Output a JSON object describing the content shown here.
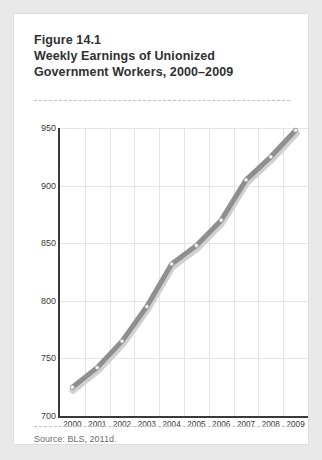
{
  "figure": {
    "label": "Figure 14.1",
    "title_line_1": "Weekly Earnings of Unionized",
    "title_line_2": "Government Workers, 2000–2009",
    "source": "Source: BLS, 2011d."
  },
  "colors": {
    "line": "#8f8f8f",
    "line_shadow": "#d0d0d0",
    "marker_fill": "#ffffff",
    "marker_stroke": "#9a9a9a",
    "axis": "#3a3a3a",
    "grid": "#e4e4e8",
    "card": "#ffffff",
    "page_background": "#e9e9e9",
    "title_text": "#2f3133",
    "source_text": "#6c6e70"
  },
  "chart_data": {
    "type": "line",
    "title": "Weekly Earnings of Unionized Government Workers, 2000–2009",
    "xlabel": "",
    "ylabel": "",
    "categories": [
      "2000",
      "2001",
      "2002",
      "2003",
      "2004",
      "2005",
      "2006",
      "2007",
      "2008",
      "2009"
    ],
    "x": [
      2000,
      2001,
      2002,
      2003,
      2004,
      2005,
      2006,
      2007,
      2008,
      2009
    ],
    "values": [
      725,
      742,
      765,
      795,
      832,
      848,
      870,
      905,
      925,
      948
    ],
    "ylim": [
      700,
      950
    ],
    "yticks": [
      700,
      750,
      800,
      850,
      900,
      950
    ],
    "ytick_labels": [
      "700",
      "750",
      "800",
      "850",
      "900",
      "950"
    ],
    "xtick_labels": [
      "2000",
      "2001",
      "2002",
      "2003",
      "2004",
      "2005",
      "2006",
      "2007",
      "2008",
      "2009"
    ],
    "grid": "vertical-and-horizontal",
    "legend": "none",
    "markers": "white-circle"
  }
}
